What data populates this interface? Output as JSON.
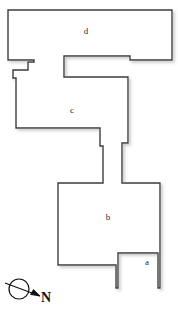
{
  "diagram": {
    "type": "floor-plan",
    "title": "",
    "background_color": "#ffffff",
    "wall_color": "#3a3a3a",
    "wall_width_px": 1.4,
    "fill_color": "#ffffff",
    "shadow_color": "#d9d9d9",
    "canvas": {
      "width": 178,
      "height": 316
    },
    "rooms": [
      {
        "id": "d",
        "label": "d",
        "label_x": 86,
        "label_y": 31
      },
      {
        "id": "c",
        "label": "c",
        "label_x": 72,
        "label_y": 110
      },
      {
        "id": "b",
        "label": "b",
        "label_x": 108,
        "label_y": 217
      },
      {
        "id": "a",
        "label": "a",
        "label_x": 147,
        "label_y": 262
      }
    ],
    "outline_points": "8,10 172,10 172,60 130,60 130,56 64,56 64,77 128,77 128,143 122,143 122,183 160,183 160,288 158,288 158,253 118,253 118,288 116,288 116,265 58,265 58,183 103,183 103,146 100,146 100,128 16,128 16,78 13,78 13,70 28,70 28,62 34,62 34,60 8,60",
    "walls": [
      {
        "name": "room-d-top-wall",
        "d": "M 8,10 L 172,10"
      },
      {
        "name": "room-d-right-wall",
        "d": "M 172,10 L 172,60"
      },
      {
        "name": "room-d-bottom-right-wall",
        "d": "M 172,60 L 64,60"
      },
      {
        "name": "corridor-upper-left-wall",
        "d": "M 64,60 L 64,77"
      },
      {
        "name": "corridor-upper-bottom-wall",
        "d": "M 64,77 L 128,77"
      },
      {
        "name": "room-c-right-wall",
        "d": "M 128,77 L 128,143"
      },
      {
        "name": "room-c-right-step",
        "d": "M 128,143 L 122,143 L 122,183"
      },
      {
        "name": "room-b-top-right-wall",
        "d": "M 122,183 L 160,183"
      },
      {
        "name": "room-a-right-wall",
        "d": "M 160,183 L 160,288"
      },
      {
        "name": "room-a-left-wall",
        "d": "M 118,253 L 118,288"
      },
      {
        "name": "room-b-bottom-right-wall",
        "d": "M 118,253 L 116,253"
      },
      {
        "name": "room-b-bottom-step",
        "d": "M 116,253 L 116,265 L 58,265"
      },
      {
        "name": "room-b-left-wall",
        "d": "M 58,265 L 58,183"
      },
      {
        "name": "room-b-top-left-wall",
        "d": "M 58,183 L 103,183"
      },
      {
        "name": "corridor-lower-right-wall",
        "d": "M 103,183 L 103,146 L 100,146 L 100,128"
      },
      {
        "name": "room-c-bottom-wall",
        "d": "M 100,128 L 16,128"
      },
      {
        "name": "room-c-left-wall",
        "d": "M 16,128 L 16,78"
      },
      {
        "name": "room-c-left-step",
        "d": "M 16,78 L 13,78 L 13,70 L 28,70 L 28,62 L 34,62 L 34,60 L 8,60"
      },
      {
        "name": "room-d-left-wall",
        "d": "M 8,60 L 8,10"
      }
    ],
    "compass": {
      "label": "N",
      "label_x": 41,
      "label_y": 291,
      "circle_cx": 19,
      "circle_cy": 289,
      "circle_r": 10,
      "needle": "M 5,283 L 40,296",
      "arrow_head": "M 40,296 L 31,294 L 34,290 Z",
      "color": "#111111"
    }
  }
}
